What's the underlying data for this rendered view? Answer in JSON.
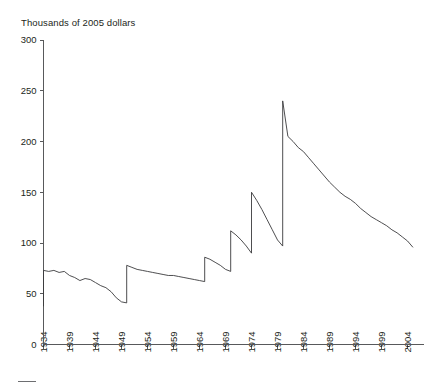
{
  "chart_data": {
    "type": "line",
    "title": "Thousands of 2005 dollars",
    "subtitle": "",
    "xlabel": "",
    "ylabel": "Thousands of 2005 dollars",
    "xlim": [
      1934,
      2006
    ],
    "ylim": [
      0,
      300
    ],
    "grid": false,
    "legend_position": "none",
    "ytick_labels": [
      "300",
      "250",
      "200",
      "150",
      "100",
      "50",
      "0"
    ],
    "ytick_values": [
      300,
      250,
      200,
      150,
      100,
      50,
      0
    ],
    "xtick_labels": [
      "1934",
      "1939",
      "1944",
      "1949",
      "1954",
      "1959",
      "1964",
      "1969",
      "1974",
      "1979",
      "1984",
      "1989",
      "1994",
      "1999",
      "2004"
    ],
    "xtick_values": [
      1934,
      1939,
      1944,
      1949,
      1954,
      1959,
      1964,
      1969,
      1974,
      1979,
      1984,
      1989,
      1994,
      1999,
      2004
    ],
    "series": [
      {
        "name": "Debt limit in thousands of 2005 dollars",
        "x": [
          1934,
          1934,
          1935,
          1936,
          1937,
          1938,
          1939,
          1940,
          1941,
          1942,
          1943,
          1944,
          1945,
          1946,
          1947,
          1948,
          1949,
          1950,
          1950,
          1951,
          1952,
          1953,
          1954,
          1955,
          1956,
          1957,
          1958,
          1959,
          1960,
          1961,
          1962,
          1963,
          1964,
          1965,
          1965,
          1966,
          1967,
          1968,
          1969,
          1970,
          1970,
          1971,
          1972,
          1973,
          1974,
          1974,
          1975,
          1976,
          1977,
          1978,
          1979,
          1980,
          1980,
          1981,
          1982,
          1983,
          1984,
          1985,
          1986,
          1987,
          1988,
          1989,
          1990,
          1991,
          1992,
          1993,
          1994,
          1995,
          1996,
          1997,
          1998,
          1999,
          2000,
          2001,
          2002,
          2003,
          2004,
          2005
        ],
        "y": [
          38,
          73,
          72,
          73,
          71,
          72,
          68,
          66,
          63,
          65,
          64,
          61,
          58,
          56,
          52,
          46,
          42,
          41,
          78,
          76,
          74,
          73,
          72,
          71,
          70,
          69,
          68,
          68,
          67,
          66,
          65,
          64,
          63,
          62,
          86,
          84,
          81,
          78,
          74,
          72,
          112,
          108,
          103,
          97,
          90,
          150,
          142,
          133,
          123,
          113,
          103,
          97,
          240,
          205,
          200,
          194,
          190,
          184,
          178,
          172,
          166,
          160,
          155,
          150,
          146,
          143,
          139,
          134,
          130,
          126,
          123,
          120,
          117,
          113,
          110,
          106,
          102,
          96
        ],
        "color": "#3a3a3c"
      }
    ],
    "annotations": []
  },
  "axes": {
    "y_axis_name": "value-axis",
    "x_axis_name": "year-axis"
  }
}
